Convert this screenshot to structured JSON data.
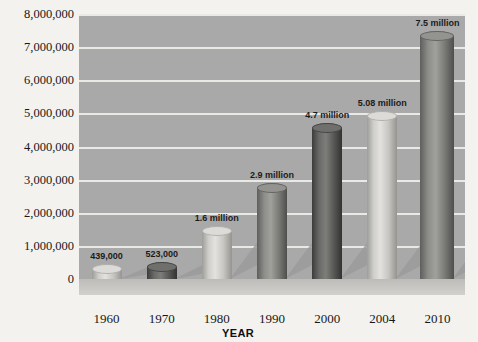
{
  "chart_data": {
    "type": "bar",
    "title": "",
    "xlabel": "YEAR",
    "ylabel": "",
    "categories": [
      "1960",
      "1970",
      "1980",
      "1990",
      "2000",
      "2004",
      "2010"
    ],
    "values": [
      439000,
      523000,
      1600000,
      2900000,
      4700000,
      5080000,
      7500000
    ],
    "point_labels": [
      "439,000",
      "523,000",
      "1.6 million",
      "2.9 million",
      "4.7 million",
      "5.08 million",
      "7.5 million"
    ],
    "ylim": [
      0,
      8000000
    ],
    "ytick_values": [
      0,
      1000000,
      2000000,
      3000000,
      4000000,
      5000000,
      6000000,
      7000000,
      8000000
    ],
    "ytick_labels": [
      "0",
      "1,000,000",
      "2,000,000",
      "3,000,000",
      "4,000,000",
      "5,000,000",
      "6,000,000",
      "7,000,000",
      "8,000,000"
    ],
    "grid": true,
    "legend": "none",
    "bar_styles": [
      "light",
      "dark",
      "light",
      "medium",
      "dark",
      "light",
      "medium"
    ],
    "colors": {
      "plot_background": "#a9a9a9",
      "page_background": "#f3f2ef",
      "gridline": "#e9e9e6",
      "light_bar": "#dcdbd7",
      "dark_bar": "#4a4a48",
      "medium_bar": "#8d8d8a",
      "text": "#16181a"
    }
  }
}
